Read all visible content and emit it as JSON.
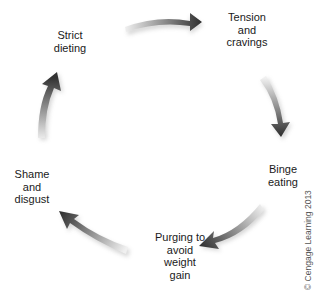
{
  "diagram": {
    "type": "cycle",
    "nodes": [
      {
        "id": "strict-dieting",
        "lines": [
          "Strict",
          "dieting"
        ]
      },
      {
        "id": "tension-cravings",
        "lines": [
          "Tension",
          "and",
          "cravings"
        ]
      },
      {
        "id": "binge-eating",
        "lines": [
          "Binge",
          "eating"
        ]
      },
      {
        "id": "purging",
        "lines": [
          "Purging to",
          "avoid",
          "weight",
          "gain"
        ]
      },
      {
        "id": "shame-disgust",
        "lines": [
          "Shame",
          "and",
          "disgust"
        ]
      }
    ],
    "edges": [
      {
        "from": "strict-dieting",
        "to": "tension-cravings"
      },
      {
        "from": "tension-cravings",
        "to": "binge-eating"
      },
      {
        "from": "binge-eating",
        "to": "purging"
      },
      {
        "from": "purging",
        "to": "shame-disgust"
      },
      {
        "from": "shame-disgust",
        "to": "strict-dieting"
      }
    ],
    "copyright": "© Cengage Learning 2013",
    "colors": {
      "arrow_dark": "#3a3a3a",
      "arrow_light": "#e8e8e8",
      "text": "#1a1a1a"
    }
  }
}
